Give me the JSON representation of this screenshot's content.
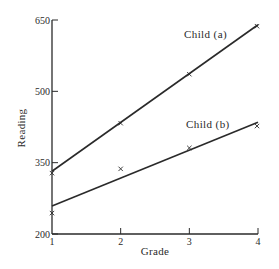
{
  "chart_data": {
    "type": "line",
    "title": "",
    "xlabel": "Grade",
    "ylabel": "Reading",
    "x": [
      1,
      2,
      3,
      4
    ],
    "x_tick_labels": [
      "1",
      "2",
      "3",
      "4"
    ],
    "y_ticks": [
      200,
      350,
      500,
      650
    ],
    "y_tick_labels": [
      "200",
      "350",
      "500",
      "650"
    ],
    "xlim": [
      1,
      4
    ],
    "ylim": [
      200,
      650
    ],
    "grid": false,
    "legend": "inline labels",
    "series": [
      {
        "name": "Child (a)",
        "observed": [
          328,
          433,
          536,
          637
        ],
        "fitted_line": {
          "start": [
            1,
            332
          ],
          "end": [
            4,
            640
          ]
        },
        "marker": "x"
      },
      {
        "name": "Child (b)",
        "observed": [
          244,
          337,
          381,
          427
        ],
        "fitted_line": {
          "start": [
            1,
            259
          ],
          "end": [
            4,
            435
          ]
        },
        "marker": "x"
      }
    ],
    "colors": {
      "ink": "#2a2a2a",
      "background": "#ffffff"
    }
  }
}
